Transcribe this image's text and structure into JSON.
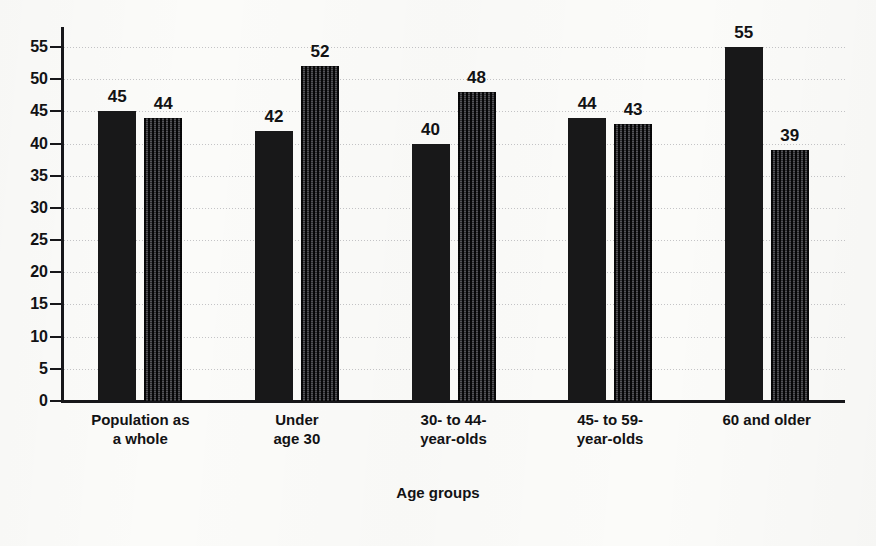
{
  "title": {
    "text": "",
    "cut_off": true
  },
  "axis": {
    "x_title": "Age groups",
    "y_ticks": [
      "0",
      "5",
      "10",
      "15",
      "20",
      "25",
      "30",
      "35",
      "40",
      "45",
      "50",
      "55"
    ]
  },
  "chart_data": {
    "type": "bar",
    "title": "",
    "xlabel": "Age groups",
    "ylabel": "",
    "ylim": [
      0,
      55
    ],
    "ytick_step": 5,
    "grid": true,
    "legend": "none",
    "grouping": "grouped",
    "categories": [
      "Population as\na whole",
      "Under\nage 30",
      "30- to 44-\nyear-olds",
      "45- to 59-\nyear-olds",
      "60 and older"
    ],
    "series": [
      {
        "name": "series-1",
        "style": "solid-black",
        "color": "#181819",
        "values": [
          45,
          42,
          40,
          44,
          55
        ]
      },
      {
        "name": "series-2",
        "style": "hatched-gray",
        "color": "#5c5c60",
        "values": [
          44,
          52,
          48,
          43,
          39
        ]
      }
    ]
  },
  "categories_display": [
    {
      "line1": "Population as",
      "line2": "a whole"
    },
    {
      "line1": "Under",
      "line2": "age 30"
    },
    {
      "line1": "30- to 44-",
      "line2": "year-olds"
    },
    {
      "line1": "45- to 59-",
      "line2": "year-olds"
    },
    {
      "line1": "60 and older",
      "line2": ""
    }
  ]
}
